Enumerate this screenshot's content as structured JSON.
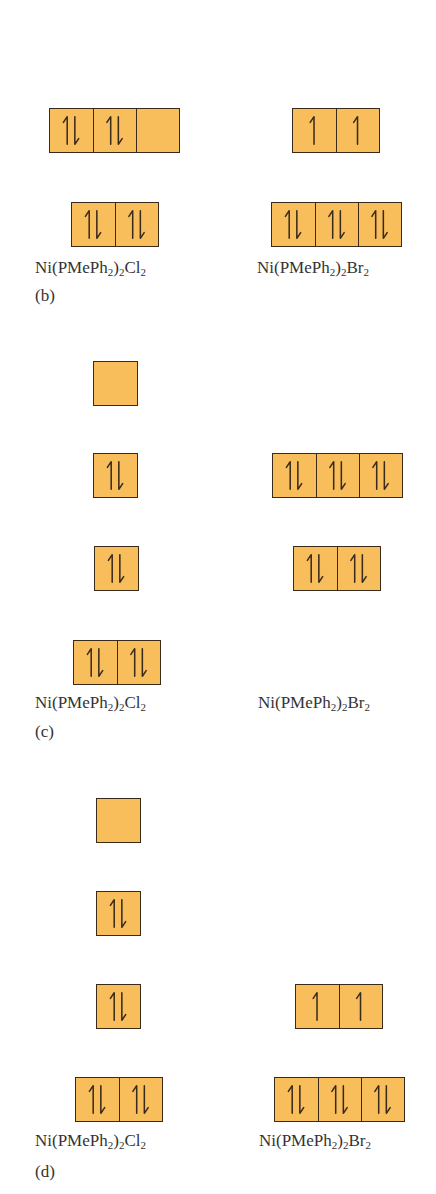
{
  "figure": {
    "fill_color": "#f8be5c",
    "border_color": "#3a2a1a",
    "panels": [
      {
        "id": "b",
        "part_label": "(b)",
        "compounds": [
          {
            "name": "Ni(PMePh2)2Cl2",
            "base": "Ni(PMePh",
            "s1": "2",
            "mid": ")",
            "s2": "2",
            "tail": "Cl",
            "s3": "2"
          },
          {
            "name": "Ni(PMePh2)2Br2",
            "base": "Ni(PMePh",
            "s1": "2",
            "mid": ")",
            "s2": "2",
            "tail": "Br",
            "s3": "2"
          }
        ],
        "levels": [
          {
            "compound": "Ni(PMePh2)2Cl2",
            "x": 49,
            "y": 108,
            "orbitals": [
              "paired",
              "paired",
              "empty"
            ]
          },
          {
            "compound": "Ni(PMePh2)2Cl2",
            "x": 71,
            "y": 202,
            "orbitals": [
              "paired",
              "paired"
            ]
          },
          {
            "compound": "Ni(PMePh2)2Br2",
            "x": 292,
            "y": 108,
            "orbitals": [
              "up",
              "up"
            ]
          },
          {
            "compound": "Ni(PMePh2)2Br2",
            "x": 271,
            "y": 202,
            "orbitals": [
              "paired",
              "paired",
              "paired"
            ]
          }
        ]
      },
      {
        "id": "c",
        "part_label": "(c)",
        "compounds": [
          {
            "name": "Ni(PMePh2)2Cl2",
            "base": "Ni(PMePh",
            "s1": "2",
            "mid": ")",
            "s2": "2",
            "tail": "Cl",
            "s3": "2"
          },
          {
            "name": "Ni(PMePh2)2Br2",
            "base": "Ni(PMePh",
            "s1": "2",
            "mid": ")",
            "s2": "2",
            "tail": "Br",
            "s3": "2"
          }
        ],
        "levels": [
          {
            "compound": "Ni(PMePh2)2Cl2",
            "x": 93,
            "y": 361,
            "orbitals": [
              "empty"
            ]
          },
          {
            "compound": "Ni(PMePh2)2Cl2",
            "x": 93,
            "y": 453,
            "orbitals": [
              "paired"
            ]
          },
          {
            "compound": "Ni(PMePh2)2Cl2",
            "x": 94,
            "y": 546,
            "orbitals": [
              "paired"
            ]
          },
          {
            "compound": "Ni(PMePh2)2Cl2",
            "x": 73,
            "y": 640,
            "orbitals": [
              "paired",
              "paired"
            ]
          },
          {
            "compound": "Ni(PMePh2)2Br2",
            "x": 272,
            "y": 453,
            "orbitals": [
              "paired",
              "paired",
              "paired"
            ]
          },
          {
            "compound": "Ni(PMePh2)2Br2",
            "x": 293,
            "y": 546,
            "orbitals": [
              "paired",
              "paired"
            ]
          }
        ]
      },
      {
        "id": "d",
        "part_label": "(d)",
        "compounds": [
          {
            "name": "Ni(PMePh2)2Cl2",
            "base": "Ni(PMePh",
            "s1": "2",
            "mid": ")",
            "s2": "2",
            "tail": "Cl",
            "s3": "2"
          },
          {
            "name": "Ni(PMePh2)2Br2",
            "base": "Ni(PMePh",
            "s1": "2",
            "mid": ")",
            "s2": "2",
            "tail": "Br",
            "s3": "2"
          }
        ],
        "levels": [
          {
            "compound": "Ni(PMePh2)2Cl2",
            "x": 96,
            "y": 798,
            "orbitals": [
              "empty"
            ]
          },
          {
            "compound": "Ni(PMePh2)2Cl2",
            "x": 96,
            "y": 891,
            "orbitals": [
              "paired"
            ]
          },
          {
            "compound": "Ni(PMePh2)2Cl2",
            "x": 96,
            "y": 984,
            "orbitals": [
              "paired"
            ]
          },
          {
            "compound": "Ni(PMePh2)2Cl2",
            "x": 75,
            "y": 1077,
            "orbitals": [
              "paired",
              "paired"
            ]
          },
          {
            "compound": "Ni(PMePh2)2Br2",
            "x": 295,
            "y": 984,
            "orbitals": [
              "up",
              "up"
            ]
          },
          {
            "compound": "Ni(PMePh2)2Br2",
            "x": 274,
            "y": 1077,
            "orbitals": [
              "paired",
              "paired",
              "paired"
            ]
          }
        ]
      }
    ]
  }
}
